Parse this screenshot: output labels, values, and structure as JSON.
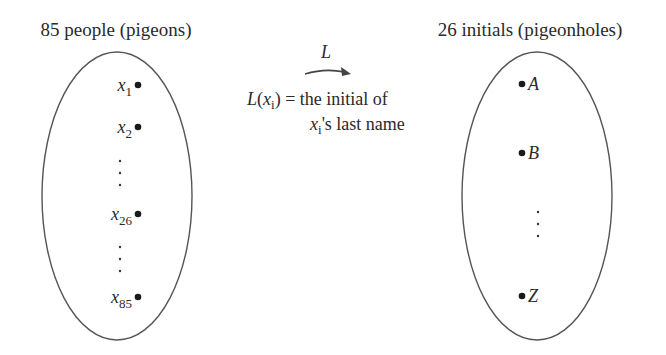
{
  "left_set": {
    "title": "85 people (pigeons)",
    "elements": [
      {
        "var": "x",
        "sub": "1"
      },
      {
        "var": "x",
        "sub": "2"
      },
      {
        "var": "x",
        "sub": "26"
      },
      {
        "var": "x",
        "sub": "85"
      }
    ],
    "ellipsis": "⋮"
  },
  "right_set": {
    "title": "26 initials (pigeonholes)",
    "elements": [
      {
        "label": "A"
      },
      {
        "label": "B"
      },
      {
        "label": "Z"
      }
    ],
    "ellipsis": "⋮"
  },
  "mapping": {
    "function_name": "L",
    "definition": {
      "fn": "L",
      "open_paren": "(",
      "var": "x",
      "sub": "i",
      "close_paren": ")",
      "equals_text": " = the initial of",
      "line2_var": "x",
      "line2_sub": "i",
      "line2_text": "'s last name"
    }
  },
  "colors": {
    "stroke": "#555555",
    "text": "#2a2a2a",
    "background": "#ffffff"
  }
}
